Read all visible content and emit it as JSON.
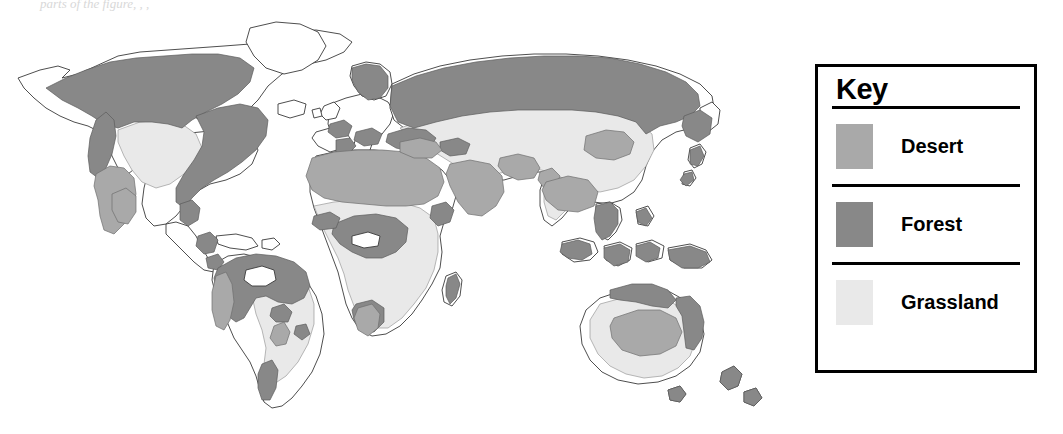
{
  "figure": {
    "type": "thematic-world-map",
    "faint_header_text": "parts of the figure, , ,"
  },
  "key": {
    "title": "Key",
    "items": [
      {
        "label": "Desert",
        "swatch": "desert-swatch",
        "color": "#a9a9a9"
      },
      {
        "label": "Forest",
        "swatch": "forest-swatch",
        "color": "#888888"
      },
      {
        "label": "Grassland",
        "swatch": "grassland-swatch",
        "color": "#e9e9e9"
      }
    ]
  },
  "map": {
    "background_color": "#ffffff",
    "coastline_color": "#3a3a3a",
    "regions": [
      {
        "name": "North America",
        "biomes": [
          "Forest",
          "Grassland",
          "Desert"
        ]
      },
      {
        "name": "South America",
        "biomes": [
          "Forest",
          "Grassland",
          "Desert"
        ]
      },
      {
        "name": "Europe",
        "biomes": [
          "Forest",
          "Grassland"
        ]
      },
      {
        "name": "Africa",
        "biomes": [
          "Desert",
          "Forest",
          "Grassland"
        ]
      },
      {
        "name": "Asia",
        "biomes": [
          "Forest",
          "Grassland",
          "Desert"
        ]
      },
      {
        "name": "Australia",
        "biomes": [
          "Desert",
          "Grassland",
          "Forest"
        ]
      },
      {
        "name": "Greenland",
        "biomes": []
      }
    ]
  }
}
